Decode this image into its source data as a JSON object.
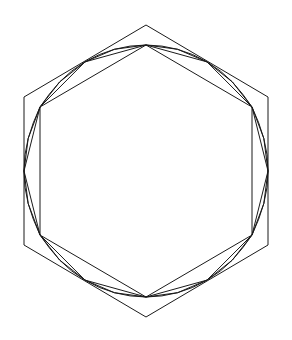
{
  "diagram": {
    "stroke_color": "#1a1a1a",
    "background": "#ffffff",
    "center": [
      146,
      171
    ],
    "outer_hexagon": {
      "points": [
        [
          146,
          25
        ],
        [
          268,
          97
        ],
        [
          268,
          245
        ],
        [
          146,
          317
        ],
        [
          24,
          245
        ],
        [
          24,
          97
        ]
      ]
    },
    "inscribed_polygons": [
      {
        "sides": 6,
        "rx": 107,
        "ry": 126,
        "start_angle_deg": -90
      },
      {
        "sides": 12,
        "rx": 122,
        "ry": 126,
        "start_angle_deg": -90
      },
      {
        "sides": 24,
        "rx": 122,
        "ry": 126,
        "start_angle_deg": -90
      },
      {
        "sides": 48,
        "rx": 122,
        "ry": 126,
        "start_angle_deg": -90
      }
    ]
  }
}
